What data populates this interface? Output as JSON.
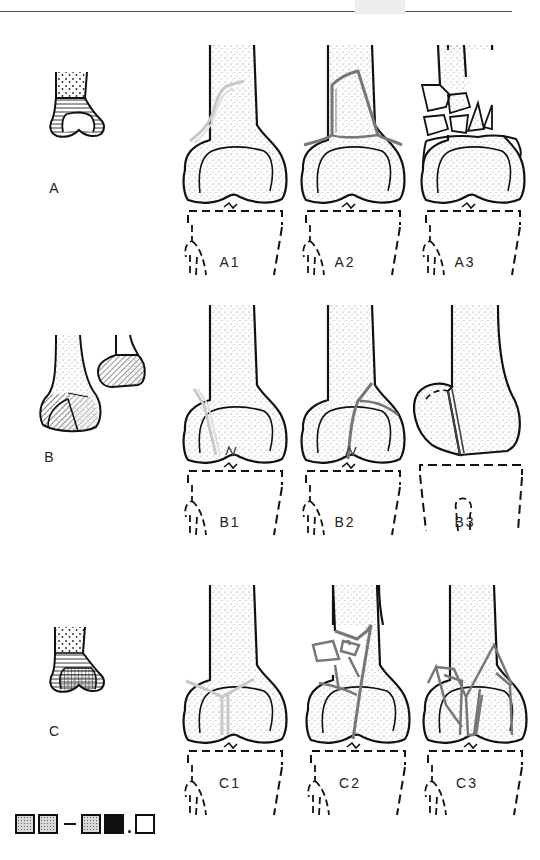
{
  "page": {
    "header_rule": true
  },
  "schematics": [
    {
      "id": "A",
      "label": "A",
      "pattern": "horizontal-lines-metaphysis"
    },
    {
      "id": "B",
      "label": "B",
      "pattern": "diagonal-hatch-condyle"
    },
    {
      "id": "C",
      "label": "C",
      "pattern": "crosshatch-articular"
    }
  ],
  "rows": [
    {
      "group": "A",
      "figures": [
        {
          "label": "A1",
          "fracture": "simple-oblique-metaphyseal"
        },
        {
          "label": "A2",
          "fracture": "metaphyseal-wedge"
        },
        {
          "label": "A3",
          "fracture": "metaphyseal-comminuted"
        }
      ]
    },
    {
      "group": "B",
      "figures": [
        {
          "label": "B1",
          "fracture": "lateral-condyle-sagittal"
        },
        {
          "label": "B2",
          "fracture": "medial-condyle-sagittal"
        },
        {
          "label": "B3",
          "fracture": "frontal-coronal-hoffa"
        }
      ]
    },
    {
      "group": "C",
      "figures": [
        {
          "label": "C1",
          "fracture": "articular-simple-metaphyseal-simple"
        },
        {
          "label": "C2",
          "fracture": "articular-simple-metaphyseal-multifragmentary"
        },
        {
          "label": "C3",
          "fracture": "multifragmentary-articular"
        }
      ]
    }
  ],
  "legend": {
    "items": [
      "dotted-square",
      "dotted-square",
      "dash",
      "dotted-square",
      "black-square",
      "period",
      "white-square"
    ]
  },
  "colors": {
    "outline": "#111111",
    "fracture_light": "#c8c8c8",
    "fracture_dark": "#777777",
    "stipple": "#888888"
  }
}
